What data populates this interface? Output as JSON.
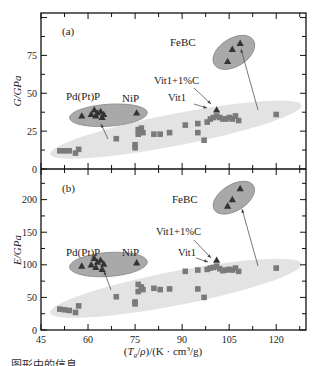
{
  "chart_data": [
    {
      "type": "scatter",
      "panel_label": "(a)",
      "title": "",
      "xlabel": "(T_g/ρ)/(K · cm³/g)",
      "ylabel": "G/GPa",
      "xlim": [
        45,
        129.5
      ],
      "ylim": [
        0,
        103
      ],
      "x_ticks": [
        45,
        60,
        75,
        90,
        105,
        120
      ],
      "y_ticks": [
        0,
        25,
        50,
        75
      ],
      "grid": false,
      "annotations": [
        "Pd(Pt)P",
        "NiP",
        "FeBC",
        "Vit1+1%C",
        "Vit1"
      ],
      "series": [
        {
          "name": "Metallic glasses (squares)",
          "marker": "square",
          "color": "#7a7a7a",
          "points": [
            [
              51,
              12
            ],
            [
              52.5,
              12
            ],
            [
              54,
              12
            ],
            [
              56,
              10.5
            ],
            [
              57,
              13
            ],
            [
              69,
              20
            ],
            [
              76,
              26
            ],
            [
              77,
              27
            ],
            [
              76,
              23
            ],
            [
              77.5,
              24
            ],
            [
              75,
              16
            ],
            [
              75,
              14
            ],
            [
              81,
              23
            ],
            [
              83,
              23
            ],
            [
              86,
              24
            ],
            [
              91,
              29
            ],
            [
              95,
              30
            ],
            [
              95,
              24
            ],
            [
              97,
              19
            ],
            [
              98,
              31
            ],
            [
              99,
              33
            ],
            [
              100,
              34
            ],
            [
              101,
              35
            ],
            [
              102,
              34
            ],
            [
              103,
              33
            ],
            [
              104,
              33
            ],
            [
              105,
              34
            ],
            [
              106,
              33
            ],
            [
              107,
              35
            ],
            [
              108,
              32
            ],
            [
              120,
              36
            ]
          ]
        },
        {
          "name": "Pd(Pt)P / NiP (triangles)",
          "marker": "triangle",
          "color": "#333333",
          "points": [
            [
              58,
              35
            ],
            [
              61,
              36
            ],
            [
              62,
              39
            ],
            [
              62.5,
              35
            ],
            [
              63,
              37
            ],
            [
              64,
              38
            ],
            [
              64.5,
              34
            ],
            [
              65,
              36
            ],
            [
              75.5,
              37
            ]
          ]
        },
        {
          "name": "Vit1+1%C",
          "marker": "triangle",
          "color": "#333333",
          "points": [
            [
              101,
              39
            ]
          ]
        },
        {
          "name": "FeBC",
          "marker": "triangle",
          "color": "#333333",
          "points": [
            [
              104.5,
              71
            ],
            [
              106,
              79
            ],
            [
              108.5,
              83
            ]
          ]
        }
      ]
    },
    {
      "type": "scatter",
      "panel_label": "(b)",
      "title": "",
      "xlabel": "(T_g/ρ)/(K · cm³/g)",
      "ylabel": "E/GPa",
      "xlim": [
        45,
        129.5
      ],
      "ylim": [
        0,
        247
      ],
      "x_ticks": [
        45,
        60,
        75,
        90,
        105,
        120
      ],
      "y_ticks": [
        0,
        50,
        100,
        150,
        200
      ],
      "grid": false,
      "annotations": [
        "Pd(Pt)P",
        "NiP",
        "FeBC",
        "Vit1+1%C",
        "Vit1"
      ],
      "series": [
        {
          "name": "Metallic glasses (squares)",
          "marker": "square",
          "color": "#7a7a7a",
          "points": [
            [
              51,
              32
            ],
            [
              52.5,
              31
            ],
            [
              54,
              30
            ],
            [
              56,
              27
            ],
            [
              57,
              37
            ],
            [
              69,
              51
            ],
            [
              76,
              70
            ],
            [
              77,
              66
            ],
            [
              76,
              59
            ],
            [
              77.5,
              62
            ],
            [
              75,
              43
            ],
            [
              75,
              40
            ],
            [
              81,
              64
            ],
            [
              83,
              62
            ],
            [
              86,
              63
            ],
            [
              91,
              90
            ],
            [
              95,
              92
            ],
            [
              95,
              63
            ],
            [
              97,
              50
            ],
            [
              98,
              93
            ],
            [
              99,
              95
            ],
            [
              100,
              96
            ],
            [
              101,
              98
            ],
            [
              102,
              94
            ],
            [
              103,
              91
            ],
            [
              104,
              92
            ],
            [
              105,
              93
            ],
            [
              106,
              92
            ],
            [
              107,
              95
            ],
            [
              108,
              90
            ],
            [
              120,
              95
            ]
          ]
        },
        {
          "name": "Pd(Pt)P / NiP (triangles)",
          "marker": "triangle",
          "color": "#333333",
          "points": [
            [
              58,
              98
            ],
            [
              61,
              100
            ],
            [
              62,
              110
            ],
            [
              62.5,
              96
            ],
            [
              63,
              104
            ],
            [
              64,
              107
            ],
            [
              64.5,
              93
            ],
            [
              65,
              101
            ],
            [
              75.5,
              103
            ]
          ]
        },
        {
          "name": "Vit1+1%C",
          "marker": "triangle",
          "color": "#333333",
          "points": [
            [
              101,
              107
            ]
          ]
        },
        {
          "name": "FeBC",
          "marker": "triangle",
          "color": "#333333",
          "points": [
            [
              104.5,
              190
            ],
            [
              106,
              200
            ],
            [
              108.5,
              217
            ]
          ]
        }
      ]
    }
  ],
  "labels": {
    "panel_a": "(a)",
    "panel_b": "(b)",
    "ylabel_a": "G/GPa",
    "ylabel_b": "E/GPa",
    "xlabel": "(Tg/ρ)/(K · cm³/g)",
    "pdptp": "Pd(Pt)P",
    "nip": "NiP",
    "febc": "FeBC",
    "vit1c": "Vit1+1%C",
    "vit1": "Vit1",
    "x_ticks": [
      "45",
      "60",
      "75",
      "90",
      "105",
      "120"
    ],
    "y_ticks_a": [
      "0",
      "25",
      "50",
      "75"
    ],
    "y_ticks_b": [
      "0",
      "50",
      "100",
      "150",
      "200"
    ]
  },
  "colors": {
    "axis": "#111111",
    "large_ellipse": "#e3e3e3",
    "small_ellipse": "#a9a9a9",
    "small_ellipse_stroke": "#888888",
    "square": "#7a7a7a",
    "triangle": "#333333"
  },
  "caption": "…图形中的信息"
}
